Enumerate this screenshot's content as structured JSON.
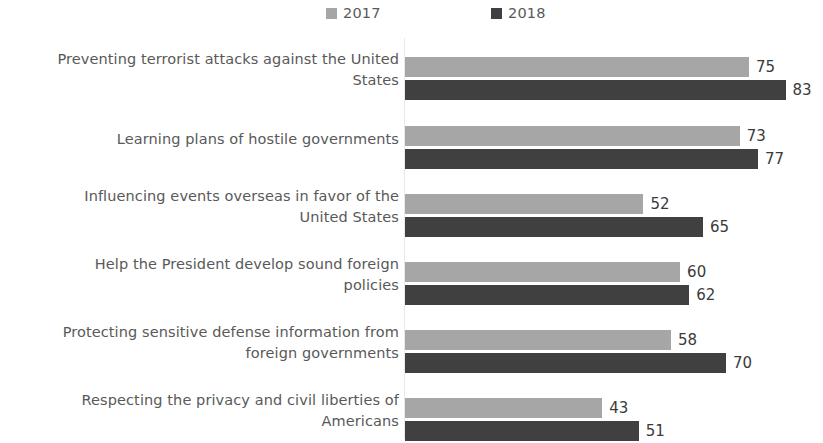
{
  "chart_data": {
    "type": "bar",
    "orientation": "horizontal",
    "title": "",
    "subtitle": "",
    "xlabel": "",
    "ylabel": "",
    "xlim": [
      0,
      90
    ],
    "grid": false,
    "legend_position": "top-center",
    "categories": [
      "Preventing terrorist attacks against the United States",
      "Learning plans of hostile governments",
      "Influencing events overseas in favor of the United States",
      "Help the President develop sound foreign policies",
      "Protecting sensitive defense information from foreign governments",
      "Respecting the privacy and civil liberties of Americans"
    ],
    "series": [
      {
        "name": "2017",
        "color": "#a6a6a6",
        "values": [
          75,
          73,
          52,
          60,
          58,
          43
        ]
      },
      {
        "name": "2018",
        "color": "#404040",
        "values": [
          83,
          77,
          65,
          62,
          70,
          51
        ]
      }
    ]
  },
  "legend": {
    "entries": [
      {
        "label": "2017",
        "swatch": "legend-swatch-2017"
      },
      {
        "label": "2018",
        "swatch": "legend-swatch-2018"
      }
    ]
  },
  "rows": [
    {
      "label_line1": "Preventing terrorist attacks against the United",
      "label_line2": "States",
      "label": "Preventing terrorist attacks against the United States",
      "v2017": "75",
      "v2018": "83"
    },
    {
      "label_line1": "Learning plans of hostile governments",
      "label_line2": "",
      "label": "Learning plans of hostile governments",
      "v2017": "73",
      "v2018": "77"
    },
    {
      "label_line1": "Influencing events overseas in favor of the",
      "label_line2": "United States",
      "label": "Influencing events overseas in favor of the United States",
      "v2017": "52",
      "v2018": "65"
    },
    {
      "label_line1": "Help the President develop sound foreign",
      "label_line2": "policies",
      "label": "Help the President develop sound foreign policies",
      "v2017": "60",
      "v2018": "62"
    },
    {
      "label_line1": "Protecting sensitive defense information from",
      "label_line2": "foreign governments",
      "label": "Protecting sensitive defense information from foreign governments",
      "v2017": "58",
      "v2018": "70"
    },
    {
      "label_line1": "Respecting the privacy and civil liberties of",
      "label_line2": "Americans",
      "label": "Respecting the privacy and civil liberties of Americans",
      "v2017": "43",
      "v2018": "51"
    }
  ],
  "colors": {
    "series_2017": "#a6a6a6",
    "series_2018": "#404040",
    "label_text": "#595959",
    "value_text": "#3b3b3b",
    "axis_line": "#e9e9e9",
    "background": "#ffffff"
  }
}
